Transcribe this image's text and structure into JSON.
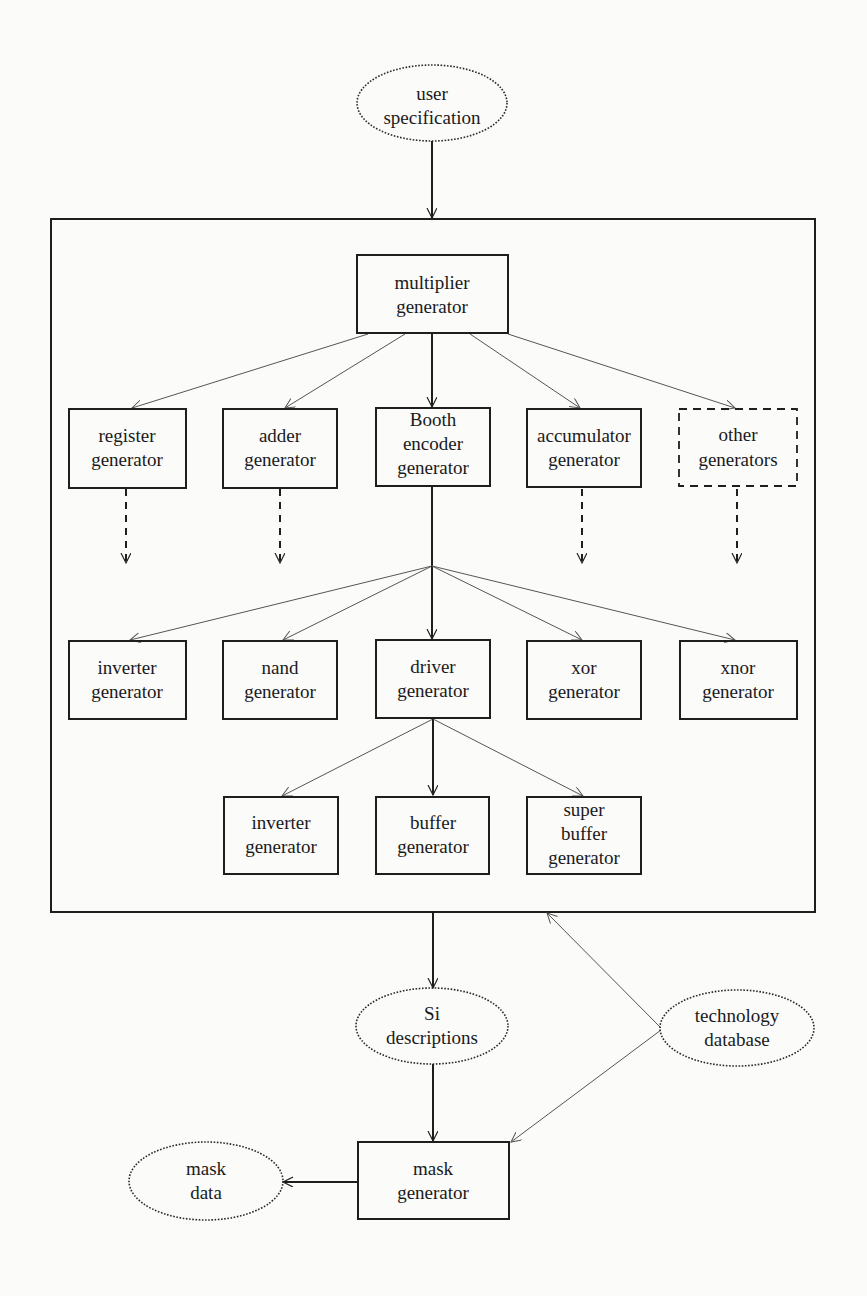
{
  "diagram": {
    "nodes": {
      "user_spec": {
        "lines": [
          "user",
          "specification"
        ],
        "shape": "ellipse"
      },
      "multiplier": {
        "lines": [
          "multiplier",
          "generator"
        ],
        "shape": "box"
      },
      "register": {
        "lines": [
          "register",
          "generator"
        ],
        "shape": "box"
      },
      "adder": {
        "lines": [
          "adder",
          "generator"
        ],
        "shape": "box"
      },
      "booth": {
        "lines": [
          "Booth",
          "encoder",
          "generator"
        ],
        "shape": "box"
      },
      "accumulator": {
        "lines": [
          "accumulator",
          "generator"
        ],
        "shape": "box"
      },
      "other": {
        "lines": [
          "other",
          "generators"
        ],
        "shape": "dashed-box"
      },
      "inverter1": {
        "lines": [
          "inverter",
          "generator"
        ],
        "shape": "box"
      },
      "nand": {
        "lines": [
          "nand",
          "generator"
        ],
        "shape": "box"
      },
      "driver": {
        "lines": [
          "driver",
          "generator"
        ],
        "shape": "box"
      },
      "xor": {
        "lines": [
          "xor",
          "generator"
        ],
        "shape": "box"
      },
      "xnor": {
        "lines": [
          "xnor",
          "generator"
        ],
        "shape": "box"
      },
      "inverter2": {
        "lines": [
          "inverter",
          "generator"
        ],
        "shape": "box"
      },
      "buffer": {
        "lines": [
          "buffer",
          "generator"
        ],
        "shape": "box"
      },
      "superbuffer": {
        "lines": [
          "super",
          "buffer",
          "generator"
        ],
        "shape": "box"
      },
      "si_desc": {
        "lines": [
          "Si",
          "descriptions"
        ],
        "shape": "ellipse"
      },
      "tech_db": {
        "lines": [
          "technology",
          "database"
        ],
        "shape": "ellipse"
      },
      "mask_gen": {
        "lines": [
          "mask",
          "generator"
        ],
        "shape": "box"
      },
      "mask_data": {
        "lines": [
          "mask",
          "data"
        ],
        "shape": "ellipse"
      }
    },
    "edges": [
      {
        "from": "user_spec",
        "to": "generator-frame",
        "style": "solid"
      },
      {
        "from": "multiplier",
        "to": "register",
        "style": "thin"
      },
      {
        "from": "multiplier",
        "to": "adder",
        "style": "thin"
      },
      {
        "from": "multiplier",
        "to": "booth",
        "style": "solid"
      },
      {
        "from": "multiplier",
        "to": "accumulator",
        "style": "thin"
      },
      {
        "from": "multiplier",
        "to": "other",
        "style": "thin"
      },
      {
        "from": "register",
        "to": "(continued)",
        "style": "dashed"
      },
      {
        "from": "adder",
        "to": "(continued)",
        "style": "dashed"
      },
      {
        "from": "accumulator",
        "to": "(continued)",
        "style": "dashed"
      },
      {
        "from": "other",
        "to": "(continued)",
        "style": "dashed"
      },
      {
        "from": "booth",
        "to": "inverter1",
        "style": "thin"
      },
      {
        "from": "booth",
        "to": "nand",
        "style": "thin"
      },
      {
        "from": "booth",
        "to": "driver",
        "style": "solid"
      },
      {
        "from": "booth",
        "to": "xor",
        "style": "thin"
      },
      {
        "from": "booth",
        "to": "xnor",
        "style": "thin"
      },
      {
        "from": "driver",
        "to": "inverter2",
        "style": "thin"
      },
      {
        "from": "driver",
        "to": "buffer",
        "style": "solid"
      },
      {
        "from": "driver",
        "to": "superbuffer",
        "style": "thin"
      },
      {
        "from": "generator-frame",
        "to": "si_desc",
        "style": "solid"
      },
      {
        "from": "tech_db",
        "to": "generator-frame",
        "style": "thin"
      },
      {
        "from": "si_desc",
        "to": "mask_gen",
        "style": "solid"
      },
      {
        "from": "tech_db",
        "to": "mask_gen",
        "style": "thin"
      },
      {
        "from": "mask_gen",
        "to": "mask_data",
        "style": "solid"
      }
    ]
  }
}
